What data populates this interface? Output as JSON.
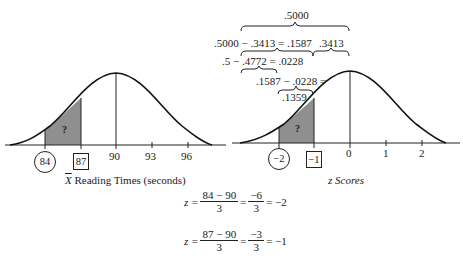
{
  "left_chart": {
    "axis_label_prefix": "X",
    "axis_label": "Reading Times (seconds)",
    "ticks": [
      "84",
      "87",
      "90",
      "93",
      "96"
    ],
    "circled_tick": "84",
    "boxed_tick": "87",
    "shaded_label": "?"
  },
  "right_chart": {
    "axis_label": "z Scores",
    "ticks": [
      "−2",
      "−1",
      "0",
      "1",
      "2"
    ],
    "circled_tick": "−2",
    "boxed_tick": "−1",
    "shaded_label": "?"
  },
  "annotations": {
    "top": ".5000",
    "line2_left": ".5000 − .3413 = .1587",
    "line2_right": ".3413",
    "line3": ".5 − .4772 = .0228",
    "line4": ".1587 − .0228 =",
    "line5": ".1359"
  },
  "equations": [
    {
      "lhs": "z =",
      "num1": "84 − 90",
      "den1": "3",
      "eq": "=",
      "num2": "−6",
      "den2": "3",
      "result": "= −2"
    },
    {
      "lhs": "z =",
      "num1": "87 − 90",
      "den1": "3",
      "eq": "=",
      "num2": "−3",
      "den2": "3",
      "result": "= −1"
    }
  ],
  "colors": {
    "shade": "#8f8f8f",
    "line": "#1a1a1a"
  }
}
